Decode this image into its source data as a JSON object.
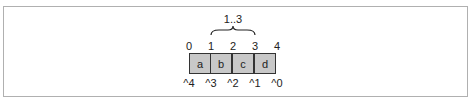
{
  "diagram": {
    "range_label": "1..3",
    "cells": [
      "a",
      "b",
      "c",
      "d"
    ],
    "top_indices": [
      "0",
      "1",
      "2",
      "3",
      "4"
    ],
    "bottom_indices": [
      "^4",
      "^3",
      "^2",
      "^1",
      "^0"
    ],
    "colors": {
      "cell_fill": "#c8c8c8",
      "cell_border": "#333333",
      "frame": "#b0b0b0"
    }
  }
}
